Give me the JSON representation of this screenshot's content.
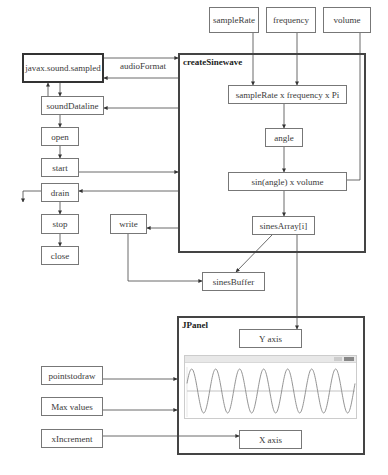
{
  "inputs_top": {
    "sample_rate": "sampleRate",
    "frequency": "frequency",
    "volume": "volume"
  },
  "library": {
    "title": "javax.sound.sampled",
    "audio_format_label": "audioFormat"
  },
  "lifecycle": {
    "steps": [
      "soundDataline",
      "open",
      "start",
      "drain",
      "stop",
      "close"
    ],
    "write": "write",
    "buffer": "sinesBuffer"
  },
  "create_sinewave": {
    "title": "createSinewave",
    "formula": "sampleRate x frequency x Pi",
    "angle": "angle",
    "sin_volume": "sin(angle) x volume",
    "array": "sinesArray[i]"
  },
  "jpanel": {
    "title": "JPanel",
    "y_axis": "Y axis",
    "x_axis": "X axis",
    "inputs": [
      "pointstodraw",
      "Max values",
      "xIncrement"
    ],
    "plot": {
      "type": "sine",
      "cycles": 7,
      "color": "#888888",
      "axis_color": "#aaaaaa"
    }
  }
}
